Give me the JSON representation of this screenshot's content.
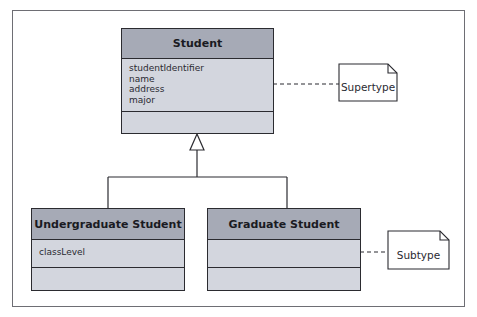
{
  "diagram": {
    "type": "UML class diagram - generalization",
    "classes": [
      {
        "name": "Student",
        "attributes": [
          "studentIdentifier",
          "name",
          "address",
          "major"
        ],
        "operations": []
      },
      {
        "name": "Undergraduate Student",
        "attributes": [
          "classLevel"
        ],
        "operations": []
      },
      {
        "name": "Graduate Student",
        "attributes": [],
        "operations": []
      }
    ],
    "notes": {
      "supertype": "Supertype",
      "subtype": "Subtype"
    },
    "relationships": [
      {
        "type": "generalization",
        "from": "Undergraduate Student",
        "to": "Student"
      },
      {
        "type": "generalization",
        "from": "Graduate Student",
        "to": "Student"
      }
    ]
  },
  "colors": {
    "header_fill": "#a6aab6",
    "body_fill": "#d3d6de",
    "border": "#2b2b30",
    "frame": "#6e6e74"
  }
}
